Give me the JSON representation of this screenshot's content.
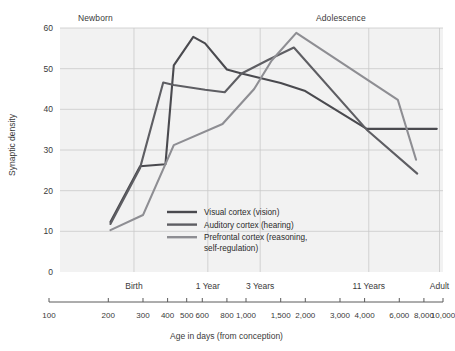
{
  "chart_data": {
    "type": "line",
    "title": "",
    "xlabel": "Age in days (from conception)",
    "ylabel": "Synaptic density",
    "xscale": "log",
    "xlim": [
      100,
      10000
    ],
    "ylim": [
      0,
      60
    ],
    "grid": true,
    "legend_position": "inside-center",
    "y_ticks": [
      0,
      10,
      20,
      30,
      40,
      50,
      60
    ],
    "y_tick_labels": [
      "0",
      "10",
      "20",
      "30",
      "40",
      "50",
      "60"
    ],
    "x_ticks": [
      100,
      200,
      300,
      400,
      500,
      600,
      800,
      1000,
      1500,
      2000,
      3000,
      4000,
      6000,
      8000,
      10000
    ],
    "x_tick_labels": [
      "100",
      "200",
      "300",
      "400",
      "500",
      "600",
      "800",
      "1,000",
      "1,500",
      "2,000",
      "3,000",
      "4,000",
      "6,000",
      "8,000",
      "10,000"
    ],
    "stage_labels": [
      {
        "text": "Birth",
        "x": 270
      },
      {
        "text": "1 Year",
        "x": 640
      },
      {
        "text": "3 Years",
        "x": 1180
      },
      {
        "text": "11 Years",
        "x": 4200
      },
      {
        "text": "Adult",
        "x": 9600
      }
    ],
    "era_labels": [
      {
        "text": "Newborn"
      },
      {
        "text": "Adolescence"
      }
    ],
    "series": [
      {
        "name": "Visual cortex (vision)",
        "color": "#4a4a4f",
        "points": [
          [
            205,
            12.3
          ],
          [
            290,
            26.0
          ],
          [
            390,
            26.5
          ],
          [
            430,
            50.8
          ],
          [
            540,
            57.8
          ],
          [
            620,
            56.2
          ],
          [
            800,
            49.8
          ],
          [
            950,
            48.8
          ],
          [
            1500,
            46.5
          ],
          [
            2000,
            44.5
          ],
          [
            4100,
            35.2
          ],
          [
            6200,
            35.2
          ],
          [
            9300,
            35.2
          ]
        ]
      },
      {
        "name": "Auditory cortex (hearing)",
        "color": "#5e5e63",
        "points": [
          [
            205,
            11.8
          ],
          [
            290,
            25.6
          ],
          [
            380,
            46.6
          ],
          [
            430,
            46.0
          ],
          [
            620,
            44.8
          ],
          [
            780,
            44.2
          ],
          [
            950,
            48.8
          ],
          [
            1300,
            52.2
          ],
          [
            1750,
            55.2
          ],
          [
            4100,
            35.0
          ],
          [
            7400,
            24.2
          ]
        ]
      },
      {
        "name": "Prefrontal cortex (reasoning, self-regulation)",
        "color": "#8e8e93",
        "points": [
          [
            205,
            10.3
          ],
          [
            300,
            14.0
          ],
          [
            430,
            31.2
          ],
          [
            760,
            36.4
          ],
          [
            1100,
            45.0
          ],
          [
            1350,
            52.0
          ],
          [
            1800,
            58.8
          ],
          [
            5900,
            42.3
          ],
          [
            7300,
            27.6
          ]
        ]
      }
    ]
  },
  "legend": {
    "items": [
      {
        "label": "Visual cortex (vision)",
        "color": "#4a4a4f"
      },
      {
        "label": "Auditory cortex (hearing)",
        "color": "#5e5e63"
      },
      {
        "label": "Prefrontal cortex (reasoning,",
        "label2": "self-regulation)",
        "color": "#8e8e93"
      }
    ]
  },
  "style": {
    "plot_background": "#f2f2f2",
    "grid_color": "#c9c9c9",
    "text_color": "#3a3a3a",
    "axis_color": "#5a5a5a"
  }
}
